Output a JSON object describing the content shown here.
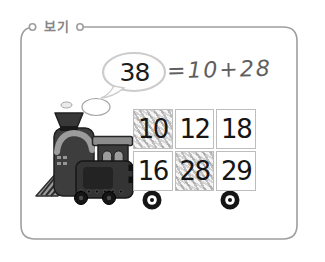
{
  "frame": {
    "label": "보기"
  },
  "thought_bubble": {
    "value": "38"
  },
  "handwritten_equation": {
    "text": "=10+28"
  },
  "wagon_grid": {
    "rows": 2,
    "columns": 3,
    "cells": [
      {
        "value": "10",
        "shaded": true
      },
      {
        "value": "12",
        "shaded": false
      },
      {
        "value": "18",
        "shaded": false
      },
      {
        "value": "16",
        "shaded": false
      },
      {
        "value": "28",
        "shaded": true
      },
      {
        "value": "29",
        "shaded": false
      }
    ]
  },
  "illustration": {
    "train": "steam-locomotive-pulling-number-wagon",
    "smoke": "smoke-puffs"
  },
  "colors": {
    "frame_border": "#9e9e9e",
    "label_text": "#858585",
    "bubble_outline": "#cccccc",
    "equation_text": "#5e5e5e",
    "number_text": "#161616",
    "cell_border": "#bdbdbd",
    "shade_hatch": "#9e9e9e",
    "train_dark": "#343434",
    "train_light": "#9c9c9c"
  }
}
